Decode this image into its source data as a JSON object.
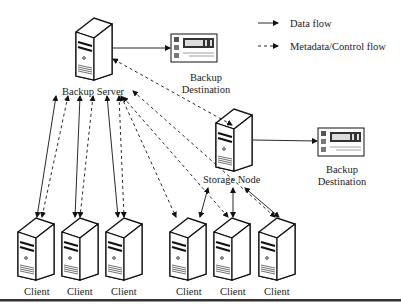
{
  "legend": {
    "data_flow": "Data flow",
    "metadata_flow": "Metadata/Control flow"
  },
  "nodes": {
    "backup_server": {
      "label": "Backup Server"
    },
    "storage_node": {
      "label": "Storage Node"
    },
    "backup_destination_1": {
      "line1": "Backup",
      "line2": "Destination"
    },
    "backup_destination_2": {
      "line1": "Backup",
      "line2": "Destination"
    },
    "clients": [
      {
        "label": "Client"
      },
      {
        "label": "Client"
      },
      {
        "label": "Client"
      },
      {
        "label": "Client"
      },
      {
        "label": "Client"
      },
      {
        "label": "Client"
      }
    ]
  },
  "colors": {
    "stroke": "#111111",
    "text": "#222222",
    "background": "#ffffff",
    "bottom_rule": "#333333"
  }
}
